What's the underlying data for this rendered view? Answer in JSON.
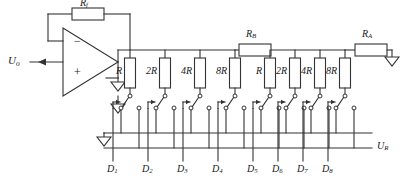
{
  "diagram": {
    "type": "circuit-schematic",
    "colors": {
      "line": "#333333",
      "text": "#1a1a1a",
      "background": "#ffffff",
      "resistor_fill": "#ffffff"
    }
  },
  "labels": {
    "output": {
      "symbol": "U",
      "sub": "o"
    },
    "reference": {
      "symbol": "U",
      "sub": "R"
    },
    "feedback_resistor": {
      "symbol": "R",
      "sub": "f"
    },
    "series_resistor_b": {
      "symbol": "R",
      "sub": "B"
    },
    "series_resistor_a": {
      "symbol": "R",
      "sub": "A"
    },
    "opamp_inverting": "−",
    "opamp_noninverting": "+"
  },
  "ladder": {
    "group_left": {
      "resistor_labels": [
        "R",
        "2R",
        "4R",
        "8R"
      ],
      "bit_labels": [
        {
          "symbol": "D",
          "sub": "1"
        },
        {
          "symbol": "D",
          "sub": "2"
        },
        {
          "symbol": "D",
          "sub": "3"
        },
        {
          "symbol": "D",
          "sub": "4"
        }
      ]
    },
    "group_right": {
      "resistor_labels": [
        "R",
        "2R",
        "4R",
        "8R"
      ],
      "bit_labels": [
        {
          "symbol": "D",
          "sub": "5"
        },
        {
          "symbol": "D",
          "sub": "6"
        },
        {
          "symbol": "D",
          "sub": "7"
        },
        {
          "symbol": "D",
          "sub": "8"
        }
      ]
    }
  },
  "geometry": {
    "resistor_x": [
      130,
      165,
      200,
      235,
      270,
      295,
      320,
      345
    ],
    "top_rail_y": 50,
    "resistor_top_y": 58,
    "resistor_bottom_y": 88,
    "switch_common_y": 96,
    "switch_throw_y": 108,
    "ground_bus_y": 133,
    "ref_bus_y": 148,
    "bit_label_y": 170
  },
  "grounds": [
    {
      "name": "opamp-noninverting-ground",
      "x": 118,
      "y": 82
    },
    {
      "name": "switch-row-ground",
      "x": 118,
      "y": 110
    },
    {
      "name": "ground-bus-ground",
      "x": 104,
      "y": 140
    },
    {
      "name": "ra-terminal-ground",
      "x": 392,
      "y": 57
    }
  ]
}
